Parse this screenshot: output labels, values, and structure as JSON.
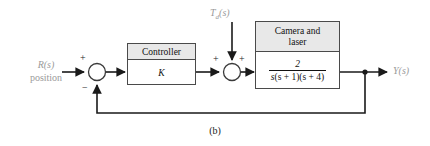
{
  "figure": {
    "caption": "(b)",
    "input_signal": "R(s)",
    "input_sublabel": "position",
    "output_signal": "Y(s)",
    "disturbance_signal": "T",
    "disturbance_subscript": "d",
    "disturbance_arg": "(s)",
    "colors": {
      "line": "#1a1a1a",
      "block_border": "#4a4a4a",
      "header_fill": "#e8e8e8",
      "body_fill": "#ffffff",
      "signal_label": "#9a9a9a",
      "text": "#111111"
    }
  },
  "summing_junction_1": {
    "name": "error-summer",
    "sign_input": "+",
    "sign_feedback": "−"
  },
  "summing_junction_2": {
    "name": "disturbance-summer",
    "sign_left": "+",
    "sign_top": "+"
  },
  "controller_block": {
    "header": "Controller",
    "body": "K"
  },
  "plant_block": {
    "header_line1": "Camera and",
    "header_line2": "laser",
    "numerator": "2",
    "denominator_s": "s",
    "denominator_rest": "(s + 1)(s + 4)"
  }
}
